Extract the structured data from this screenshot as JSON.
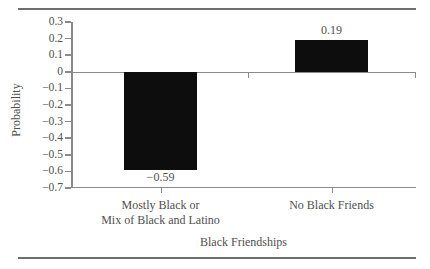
{
  "chart_data": {
    "type": "bar",
    "title": "",
    "xlabel": "Black Friendships",
    "ylabel": "Probability",
    "categories": [
      "Mostly Black or Mix of Black and Latino",
      "No Black Friends"
    ],
    "category_lines": [
      [
        "Mostly Black or",
        "Mix of Black and Latino"
      ],
      [
        "No Black Friends"
      ]
    ],
    "values": [
      -0.59,
      0.19
    ],
    "value_labels": [
      "−0.59",
      "0.19"
    ],
    "ylim": [
      -0.7,
      0.3
    ],
    "ytick_values": [
      0.3,
      0.2,
      0.1,
      0,
      -0.1,
      -0.2,
      -0.3,
      -0.4,
      -0.5,
      -0.6,
      -0.7
    ],
    "ytick_labels": [
      "0.3",
      "0.2",
      "0.1",
      "0",
      "−0.1",
      "−0.2",
      "−0.3",
      "−0.4",
      "−0.5",
      "−0.6",
      "−0.7"
    ],
    "grid": false,
    "legend": "none",
    "bar_color": "#0d0d0d",
    "axis_color": "#8a8a8a",
    "text_color": "#4f4f4f"
  }
}
